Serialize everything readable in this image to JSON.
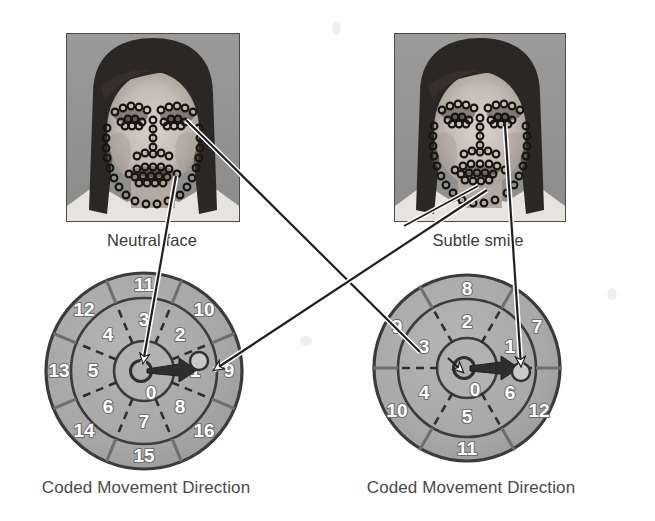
{
  "figure": {
    "background_color": "#fefefe",
    "ring_fill": "#a9a9a9",
    "ring_fill_dark": "#9b9b9b",
    "center_fill": "#b4b4b4",
    "stroke_color": "#3b3b3b",
    "numeral_color": "#ffffff",
    "arrow_color": "#2e2e2e"
  },
  "panels": [
    {
      "id": "left",
      "photo_caption": "Neutral face",
      "dial_caption": "Coded Movement Direction",
      "dial": {
        "center_label": "0",
        "inner_ring_labels": [
          "1",
          "2",
          "3",
          "4",
          "5",
          "6",
          "7",
          "8"
        ],
        "outer_ring_labels": [
          "9",
          "10",
          "11",
          "12",
          "13",
          "14",
          "15",
          "16"
        ],
        "inner_sectors": 8,
        "outer_sectors": 8,
        "vector_direction_code": "1",
        "vector_angle_deg": 0
      }
    },
    {
      "id": "right",
      "photo_caption": "Subtle smile",
      "dial_caption": "Coded Movement Direction",
      "dial": {
        "center_label": "0",
        "inner_ring_labels": [
          "1",
          "2",
          "3",
          "4",
          "5",
          "6"
        ],
        "outer_ring_labels": [
          "7",
          "8",
          "9",
          "10",
          "11",
          "12"
        ],
        "inner_sectors": 6,
        "outer_sectors": 6,
        "vector_direction_code": "6",
        "vector_angle_deg": 0
      }
    }
  ],
  "connectors": [
    {
      "name": "neutral-eye-to-left-dial-marker",
      "from": "left-face-eye",
      "to": "left-dial-outer-marker"
    },
    {
      "name": "neutral-mouth-to-left-dial-center",
      "from": "left-face-mouth",
      "to": "left-dial-center"
    },
    {
      "name": "smile-mouth-to-left-dial-marker",
      "from": "right-face-mouth",
      "to": "right-dial-center"
    },
    {
      "name": "smile-eye-to-right-dial-marker",
      "from": "right-face-eye",
      "to": "right-dial-marker"
    }
  ]
}
